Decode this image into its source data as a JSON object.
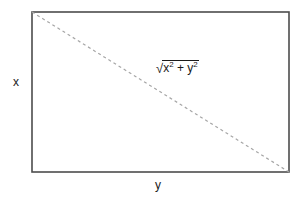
{
  "figure": {
    "background_color": "#ffffff",
    "rectangle": {
      "name": "rectangle-outline",
      "stroke_color": "#4d4d4d",
      "stroke_width": 1.6,
      "fill": "none",
      "x": 32,
      "y": 12,
      "width": 257,
      "height": 160
    },
    "diagonal": {
      "name": "diagonal-dashed-line",
      "stroke_color": "#a6a6a6",
      "stroke_width": 1.2,
      "dash_pattern": "3 3",
      "x1": 32,
      "y1": 12,
      "x2": 289,
      "y2": 172
    },
    "labels": {
      "vertical_side": "x",
      "horizontal_side": "y"
    },
    "formula": {
      "radical_symbol": "√",
      "term_one_base": "x",
      "term_one_exponent": "2",
      "operator": "+",
      "term_two_base": "y",
      "term_two_exponent": "2",
      "plain_text": "√(x² + y²)"
    },
    "text_color": "#1a1a1a"
  }
}
